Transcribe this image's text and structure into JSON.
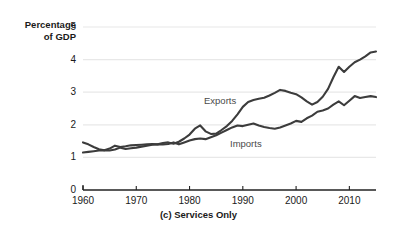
{
  "chart_data": {
    "type": "line",
    "title": "(c) Services Only",
    "xlabel": "",
    "ylabel": "Percentage of GDP",
    "ylabel_line1": "Percentage",
    "ylabel_line2": "of GDP",
    "xlim": [
      1960,
      2015
    ],
    "ylim": [
      0,
      5
    ],
    "yticks": [
      "0",
      "1",
      "2",
      "3",
      "4",
      "5"
    ],
    "ytick_values": [
      0,
      1,
      2,
      3,
      4,
      5
    ],
    "xticks": [
      "1960",
      "1970",
      "1980",
      "1990",
      "2000",
      "2010"
    ],
    "xtick_values": [
      1960,
      1970,
      1980,
      1990,
      2000,
      2010
    ],
    "grid": "horizontal",
    "legend_position": "inline-annotation",
    "line_color": "#3c3c3c",
    "grid_color": "#e8e8e8",
    "axis_color": "#222222",
    "background": "#ffffff",
    "x": [
      1960,
      1961,
      1962,
      1963,
      1964,
      1965,
      1966,
      1967,
      1968,
      1969,
      1970,
      1971,
      1972,
      1973,
      1974,
      1975,
      1976,
      1977,
      1978,
      1979,
      1980,
      1981,
      1982,
      1983,
      1984,
      1985,
      1986,
      1987,
      1988,
      1989,
      1990,
      1991,
      1992,
      1993,
      1994,
      1995,
      1996,
      1997,
      1998,
      1999,
      2000,
      2001,
      2002,
      2003,
      2004,
      2005,
      2006,
      2007,
      2008,
      2009,
      2010,
      2011,
      2012,
      2013,
      2014,
      2015
    ],
    "series": [
      {
        "name": "Exports",
        "label": "Exports",
        "values": [
          1.46,
          1.4,
          1.32,
          1.25,
          1.22,
          1.27,
          1.36,
          1.32,
          1.34,
          1.37,
          1.38,
          1.39,
          1.4,
          1.41,
          1.4,
          1.44,
          1.46,
          1.42,
          1.48,
          1.58,
          1.7,
          1.88,
          1.98,
          1.8,
          1.72,
          1.73,
          1.84,
          1.96,
          2.12,
          2.32,
          2.55,
          2.7,
          2.76,
          2.8,
          2.83,
          2.9,
          2.98,
          3.07,
          3.04,
          2.98,
          2.94,
          2.84,
          2.72,
          2.62,
          2.7,
          2.86,
          3.1,
          3.46,
          3.78,
          3.62,
          3.78,
          3.92,
          4.0,
          4.1,
          4.22,
          4.25
        ]
      },
      {
        "name": "Imports",
        "label": "Imports",
        "values": [
          1.15,
          1.17,
          1.19,
          1.21,
          1.22,
          1.21,
          1.24,
          1.3,
          1.26,
          1.28,
          1.3,
          1.33,
          1.36,
          1.39,
          1.4,
          1.4,
          1.41,
          1.46,
          1.4,
          1.46,
          1.52,
          1.56,
          1.58,
          1.56,
          1.62,
          1.68,
          1.76,
          1.84,
          1.92,
          1.98,
          1.96,
          2.0,
          2.04,
          1.98,
          1.93,
          1.9,
          1.88,
          1.92,
          1.98,
          2.04,
          2.12,
          2.09,
          2.2,
          2.28,
          2.4,
          2.44,
          2.5,
          2.62,
          2.72,
          2.6,
          2.74,
          2.88,
          2.82,
          2.85,
          2.88,
          2.85
        ]
      }
    ]
  }
}
